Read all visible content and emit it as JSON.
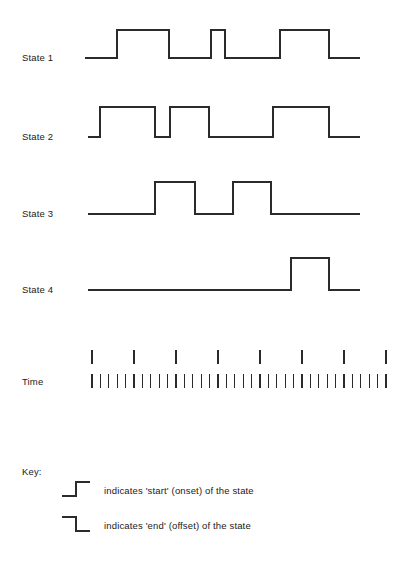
{
  "figure": {
    "title": "",
    "width": 417,
    "height": 575,
    "background": "#ffffff",
    "line_color": "#2b2b2b",
    "text_color": "#1a1a1a"
  },
  "chart_data": {
    "type": "line",
    "title": "",
    "subtitle": "",
    "xlabel": "Time",
    "ylabel": "",
    "grid": false,
    "legend_position": "bottom-left",
    "x_range": [
      85,
      360
    ],
    "track_labels": [
      "State 1",
      "State 2",
      "State 3",
      "State 4"
    ],
    "time_label": "Time",
    "tracks": [
      {
        "name": "State 1",
        "label": "State 1",
        "baseline_y": 58,
        "high_y": 30,
        "line_start_x": 85,
        "line_end_x": 360,
        "intervals": [
          {
            "start": 117,
            "end": 169
          },
          {
            "start": 211,
            "end": 225
          },
          {
            "start": 280,
            "end": 329
          }
        ]
      },
      {
        "name": "State 2",
        "label": "State 2",
        "baseline_y": 137,
        "high_y": 107,
        "line_start_x": 88,
        "line_end_x": 360,
        "intervals": [
          {
            "start": 100,
            "end": 155
          },
          {
            "start": 170,
            "end": 209
          },
          {
            "start": 273,
            "end": 329
          }
        ]
      },
      {
        "name": "State 3",
        "label": "State 3",
        "baseline_y": 214,
        "high_y": 182,
        "line_start_x": 88,
        "line_end_x": 360,
        "intervals": [
          {
            "start": 155,
            "end": 195
          },
          {
            "start": 233,
            "end": 271
          }
        ]
      },
      {
        "name": "State 4",
        "label": "State 4",
        "baseline_y": 290,
        "high_y": 258,
        "line_start_x": 88,
        "line_end_x": 360,
        "intervals": [
          {
            "start": 291,
            "end": 329
          }
        ]
      }
    ],
    "time_axis": {
      "label": "Time",
      "major_ticks": {
        "count": 8,
        "positions": [
          92,
          134,
          176,
          218,
          260,
          302,
          344,
          386
        ],
        "y_top": 350,
        "y_bottom": 364
      },
      "minor_ticks": {
        "count": 36,
        "start_x": 92,
        "spacing": 8.4,
        "y_top": 374,
        "y_bottom": 388
      }
    }
  },
  "labels": {
    "state1": "State 1",
    "state1_y": 61,
    "state2": "State 2",
    "state2_y": 140,
    "state3": "State 3",
    "state3_y": 214,
    "state4": "State 4",
    "state4_y": 290,
    "time": "Time",
    "time_y": 385,
    "label_x": 22
  },
  "key": {
    "title": "Key:",
    "title_x": 22,
    "title_y": 475,
    "entries": [
      {
        "glyph": "rising-step-icon",
        "glyph_type": "start",
        "text": "indicates 'start' (onset) of the state",
        "text_x": 104,
        "text_y": 494,
        "glyph_x": 62,
        "glyph_y": 482
      },
      {
        "glyph": "falling-step-icon",
        "glyph_type": "end",
        "text": "indicates 'end' (offset) of the state",
        "text_x": 104,
        "text_y": 529,
        "glyph_x": 62,
        "glyph_y": 517
      }
    ]
  }
}
